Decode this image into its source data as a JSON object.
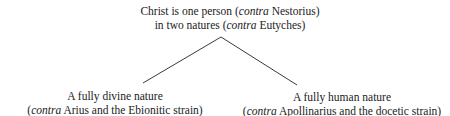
{
  "diagram": {
    "type": "tree",
    "root": {
      "line1_pre": "Christ is one person (",
      "line1_em": "contra",
      "line1_post": " Nestorius)",
      "line2_pre": "in two natures (",
      "line2_em": "contra",
      "line2_post": " Eutyches)"
    },
    "children": [
      {
        "line1": "A fully divine nature",
        "line2_pre": "(",
        "line2_em": "contra",
        "line2_post": " Arius and the Ebionitic strain)"
      },
      {
        "line1": "A fully human nature",
        "line2_pre": "(",
        "line2_em": "contra",
        "line2_post": " Apollinarius and the docetic strain)"
      }
    ],
    "edges": [
      {
        "from": "root",
        "to": "children.0"
      },
      {
        "from": "root",
        "to": "children.1"
      }
    ],
    "line_color": "#3a3a3a",
    "text_color": "#222222"
  }
}
